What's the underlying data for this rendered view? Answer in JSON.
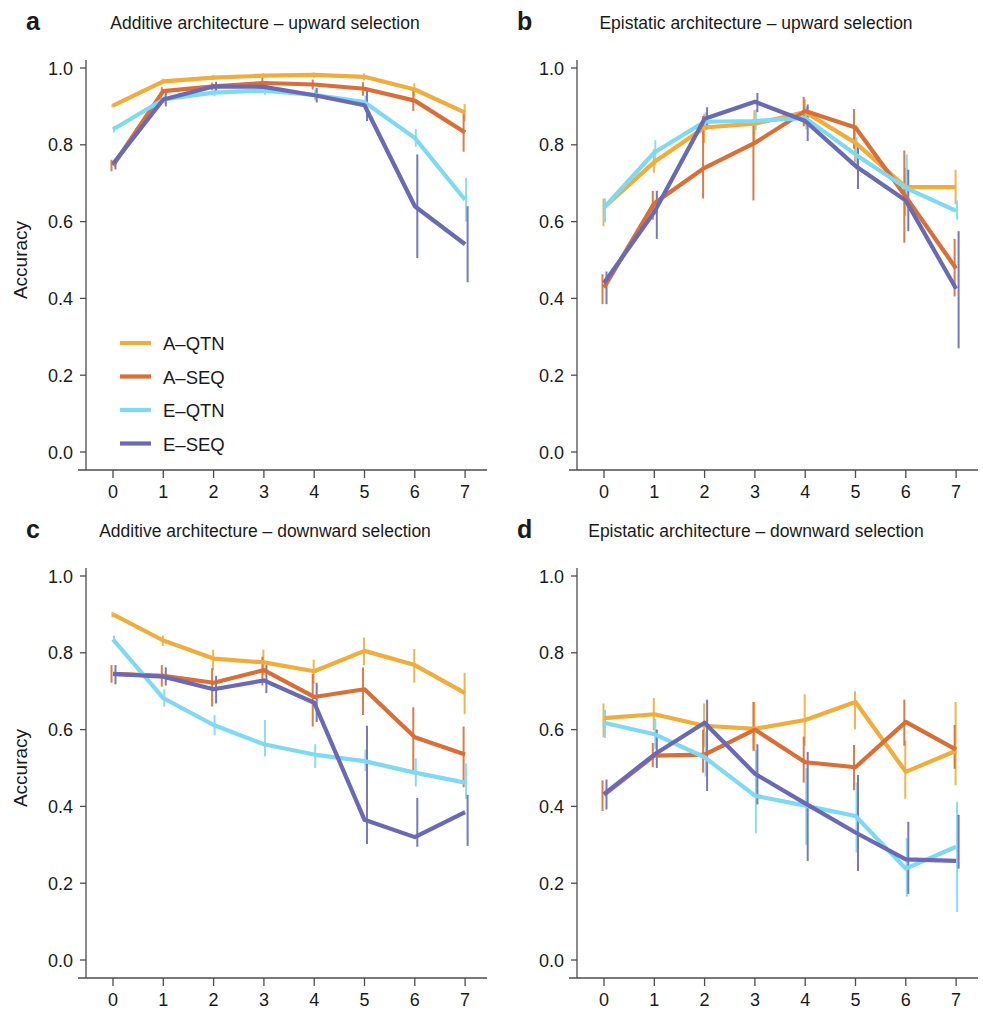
{
  "figure": {
    "axis_titles": {
      "y": "Accuracy",
      "x": "Generation"
    },
    "y_ticks": [
      "0.0",
      "0.2",
      "0.4",
      "0.6",
      "0.8",
      "1.0"
    ],
    "x_ticks": [
      "0",
      "1",
      "2",
      "3",
      "4",
      "5",
      "6",
      "7"
    ]
  },
  "series_colors": {
    "A-QTN": "#f0ad3c",
    "A-SEQ": "#d96f36",
    "E-QTN": "#7fd9f2",
    "E-SEQ": "#6a6ab4"
  },
  "legend": {
    "position": "panel-a-lower-left",
    "items": [
      {
        "label": "A–QTN",
        "color": "#f0ad3c"
      },
      {
        "label": "A–SEQ",
        "color": "#d96f36"
      },
      {
        "label": "E–QTN",
        "color": "#7fd9f2"
      },
      {
        "label": "E–SEQ",
        "color": "#6a6ab4"
      }
    ]
  },
  "panels": [
    {
      "id": "a",
      "letter": "a",
      "title": "Additive architecture – upward selection"
    },
    {
      "id": "b",
      "letter": "b",
      "title": "Epistatic architecture – upward selection"
    },
    {
      "id": "c",
      "letter": "c",
      "title": "Additive architecture – downward selection"
    },
    {
      "id": "d",
      "letter": "d",
      "title": "Epistatic architecture – downward selection"
    }
  ],
  "chart_data": [
    {
      "panel": "a",
      "type": "line",
      "title": "Additive architecture – upward selection",
      "xlabel": "Generation",
      "ylabel": "Accuracy",
      "x": [
        0,
        1,
        2,
        3,
        4,
        5,
        6,
        7
      ],
      "xlim": [
        -0.4,
        7.4
      ],
      "ylim": [
        -0.04,
        1.06
      ],
      "grid": false,
      "legend": "inside-lower-left",
      "series": [
        {
          "name": "A–QTN",
          "color": "#f0ad3c",
          "values": [
            0.902,
            0.965,
            0.975,
            0.98,
            0.982,
            0.977,
            0.944,
            0.884
          ],
          "err_low": [
            0.898,
            0.958,
            0.969,
            0.974,
            0.975,
            0.968,
            0.925,
            0.861
          ],
          "err_high": [
            0.906,
            0.972,
            0.981,
            0.986,
            0.988,
            0.986,
            0.96,
            0.906
          ]
        },
        {
          "name": "A–SEQ",
          "color": "#d96f36",
          "values": [
            0.746,
            0.94,
            0.952,
            0.961,
            0.957,
            0.946,
            0.915,
            0.832
          ],
          "err_low": [
            0.731,
            0.93,
            0.942,
            0.948,
            0.944,
            0.928,
            0.888,
            0.782
          ],
          "err_high": [
            0.761,
            0.95,
            0.962,
            0.974,
            0.97,
            0.963,
            0.94,
            0.882
          ]
        },
        {
          "name": "E–QTN",
          "color": "#7fd9f2",
          "values": [
            0.84,
            0.918,
            0.936,
            0.941,
            0.93,
            0.911,
            0.818,
            0.657
          ],
          "err_low": [
            0.832,
            0.908,
            0.926,
            0.93,
            0.916,
            0.894,
            0.795,
            0.6
          ],
          "err_high": [
            0.848,
            0.928,
            0.946,
            0.952,
            0.944,
            0.928,
            0.841,
            0.714
          ]
        },
        {
          "name": "E–SEQ",
          "color": "#6a6ab4",
          "values": [
            0.75,
            0.918,
            0.952,
            0.951,
            0.929,
            0.903,
            0.64,
            0.541
          ],
          "err_low": [
            0.736,
            0.9,
            0.94,
            0.936,
            0.91,
            0.862,
            0.505,
            0.442
          ],
          "err_high": [
            0.764,
            0.936,
            0.964,
            0.966,
            0.948,
            0.944,
            0.775,
            0.64
          ]
        }
      ]
    },
    {
      "panel": "b",
      "type": "line",
      "title": "Epistatic architecture – upward selection",
      "xlabel": "Generation",
      "ylabel": "Accuracy",
      "x": [
        0,
        1,
        2,
        3,
        4,
        5,
        6,
        7
      ],
      "xlim": [
        -0.4,
        7.4
      ],
      "ylim": [
        -0.04,
        1.06
      ],
      "grid": false,
      "legend": "none",
      "series": [
        {
          "name": "A–QTN",
          "color": "#f0ad3c",
          "values": [
            0.637,
            0.755,
            0.845,
            0.855,
            0.885,
            0.805,
            0.69,
            0.69
          ],
          "err_low": [
            0.588,
            0.727,
            0.805,
            0.8,
            0.85,
            0.755,
            0.615,
            0.645
          ],
          "err_high": [
            0.66,
            0.788,
            0.88,
            0.89,
            0.918,
            0.85,
            0.74,
            0.735
          ]
        },
        {
          "name": "A–SEQ",
          "color": "#d96f36",
          "values": [
            0.428,
            0.648,
            0.74,
            0.805,
            0.888,
            0.845,
            0.665,
            0.478
          ],
          "err_low": [
            0.385,
            0.605,
            0.66,
            0.655,
            0.848,
            0.79,
            0.545,
            0.405
          ],
          "err_high": [
            0.463,
            0.68,
            0.875,
            0.866,
            0.925,
            0.893,
            0.785,
            0.555
          ]
        },
        {
          "name": "E–QTN",
          "color": "#7fd9f2",
          "values": [
            0.636,
            0.78,
            0.86,
            0.862,
            0.87,
            0.775,
            0.688,
            0.628
          ],
          "err_low": [
            0.598,
            0.745,
            0.838,
            0.838,
            0.84,
            0.735,
            0.64,
            0.605
          ],
          "err_high": [
            0.66,
            0.812,
            0.885,
            0.892,
            0.9,
            0.82,
            0.775,
            0.655
          ]
        },
        {
          "name": "E–SEQ",
          "color": "#6a6ab4",
          "values": [
            0.44,
            0.625,
            0.868,
            0.912,
            0.862,
            0.745,
            0.655,
            0.425
          ],
          "err_low": [
            0.385,
            0.555,
            0.84,
            0.885,
            0.81,
            0.685,
            0.575,
            0.27
          ],
          "err_high": [
            0.47,
            0.68,
            0.898,
            0.935,
            0.905,
            0.8,
            0.735,
            0.575
          ]
        }
      ]
    },
    {
      "panel": "c",
      "type": "line",
      "title": "Additive architecture – downward selection",
      "xlabel": "Generation",
      "ylabel": "Accuracy",
      "x": [
        0,
        1,
        2,
        3,
        4,
        5,
        6,
        7
      ],
      "xlim": [
        -0.4,
        7.4
      ],
      "ylim": [
        -0.04,
        1.06
      ],
      "grid": false,
      "legend": "none",
      "series": [
        {
          "name": "A–QTN",
          "color": "#f0ad3c",
          "values": [
            0.9,
            0.832,
            0.785,
            0.775,
            0.752,
            0.805,
            0.768,
            0.695
          ],
          "err_low": [
            0.892,
            0.818,
            0.755,
            0.742,
            0.72,
            0.768,
            0.722,
            0.64
          ],
          "err_high": [
            0.906,
            0.845,
            0.808,
            0.808,
            0.782,
            0.84,
            0.81,
            0.748
          ]
        },
        {
          "name": "A–SEQ",
          "color": "#d96f36",
          "values": [
            0.745,
            0.74,
            0.722,
            0.755,
            0.685,
            0.705,
            0.58,
            0.535
          ],
          "err_low": [
            0.722,
            0.712,
            0.66,
            0.715,
            0.608,
            0.638,
            0.485,
            0.45
          ],
          "err_high": [
            0.768,
            0.768,
            0.76,
            0.79,
            0.745,
            0.762,
            0.658,
            0.608
          ]
        },
        {
          "name": "E–QTN",
          "color": "#7fd9f2",
          "values": [
            0.835,
            0.682,
            0.612,
            0.562,
            0.535,
            0.518,
            0.488,
            0.462
          ],
          "err_low": [
            0.825,
            0.66,
            0.585,
            0.53,
            0.5,
            0.492,
            0.452,
            0.42
          ],
          "err_high": [
            0.845,
            0.705,
            0.638,
            0.625,
            0.562,
            0.548,
            0.525,
            0.512
          ]
        },
        {
          "name": "E–SEQ",
          "color": "#6a6ab4",
          "values": [
            0.745,
            0.738,
            0.705,
            0.728,
            0.67,
            0.365,
            0.32,
            0.385
          ],
          "err_low": [
            0.718,
            0.715,
            0.668,
            0.695,
            0.62,
            0.302,
            0.295,
            0.297
          ],
          "err_high": [
            0.768,
            0.762,
            0.74,
            0.768,
            0.722,
            0.61,
            0.422,
            0.43
          ]
        }
      ]
    },
    {
      "panel": "d",
      "type": "line",
      "title": "Epistatic architecture – downward selection",
      "xlabel": "Generation",
      "ylabel": "Accuracy",
      "x": [
        0,
        1,
        2,
        3,
        4,
        5,
        6,
        7
      ],
      "xlim": [
        -0.4,
        7.4
      ],
      "ylim": [
        -0.04,
        1.06
      ],
      "grid": false,
      "legend": "none",
      "series": [
        {
          "name": "A–QTN",
          "color": "#f0ad3c",
          "values": [
            0.63,
            0.64,
            0.61,
            0.602,
            0.625,
            0.672,
            0.49,
            0.545
          ],
          "err_low": [
            0.58,
            0.598,
            0.555,
            0.545,
            0.558,
            0.6,
            0.42,
            0.455
          ],
          "err_high": [
            0.668,
            0.682,
            0.668,
            0.672,
            0.692,
            0.7,
            0.572,
            0.672
          ]
        },
        {
          "name": "A–SEQ",
          "color": "#d96f36",
          "values": [
            0.43,
            0.532,
            0.535,
            0.6,
            0.515,
            0.502,
            0.62,
            0.548
          ],
          "err_low": [
            0.388,
            0.502,
            0.488,
            0.545,
            0.462,
            0.442,
            0.558,
            0.498
          ],
          "err_high": [
            0.468,
            0.565,
            0.6,
            0.672,
            0.582,
            0.56,
            0.678,
            0.612
          ]
        },
        {
          "name": "E–QTN",
          "color": "#7fd9f2",
          "values": [
            0.618,
            0.588,
            0.528,
            0.428,
            0.402,
            0.375,
            0.238,
            0.295
          ],
          "err_low": [
            0.578,
            0.55,
            0.478,
            0.33,
            0.3,
            0.28,
            0.165,
            0.125
          ],
          "err_high": [
            0.652,
            0.628,
            0.595,
            0.548,
            0.5,
            0.462,
            0.318,
            0.412
          ]
        },
        {
          "name": "E–SEQ",
          "color": "#6a6ab4",
          "values": [
            0.432,
            0.535,
            0.618,
            0.485,
            0.408,
            0.332,
            0.262,
            0.258
          ],
          "err_low": [
            0.392,
            0.5,
            0.44,
            0.405,
            0.258,
            0.232,
            0.172,
            0.238
          ],
          "err_high": [
            0.47,
            0.6,
            0.678,
            0.562,
            0.542,
            0.482,
            0.36,
            0.378
          ]
        }
      ]
    }
  ]
}
